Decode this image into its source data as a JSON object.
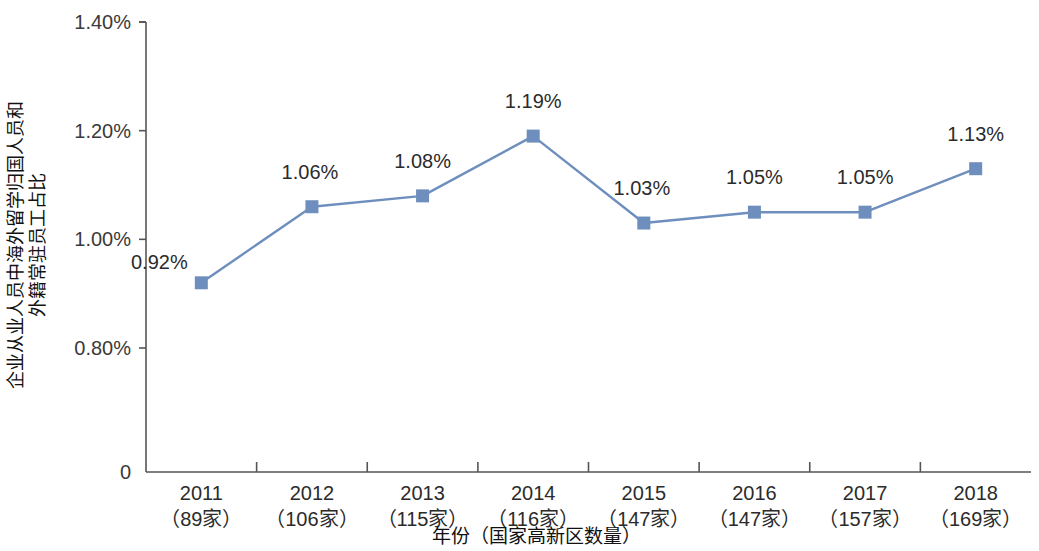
{
  "chart_data": {
    "type": "line",
    "title": "",
    "xlabel": "年份（国家高新区数量）",
    "ylabel": "企业从业人员中海外留学归国人员和外籍常驻员工占比",
    "ylabel_line1": "企业从业人员中海外留学归国人员和",
    "ylabel_line2": "外籍常驻员工占比",
    "categories": [
      "2011",
      "2012",
      "2013",
      "2014",
      "2015",
      "2016",
      "2017",
      "2018"
    ],
    "category_sublabels": [
      "（89家）",
      "（106家）",
      "（115家）",
      "（116家）",
      "（147家）",
      "（147家）",
      "（157家）",
      "（169家）"
    ],
    "values": [
      0.92,
      1.06,
      1.08,
      1.19,
      1.03,
      1.05,
      1.05,
      1.13
    ],
    "value_labels": [
      "0.92%",
      "1.06%",
      "1.08%",
      "1.19%",
      "1.03%",
      "1.05%",
      "1.05%",
      "1.13%"
    ],
    "ytick_labels": [
      "0",
      "0.80%",
      "1.00%",
      "1.20%",
      "1.40%"
    ],
    "ytick_values": [
      0,
      0.8,
      1.0,
      1.2,
      1.4
    ],
    "ylim": [
      0.8,
      1.4
    ],
    "axis_break": true,
    "grid": false,
    "legend": false,
    "series_color": "#6e8fbd",
    "marker": "square",
    "axis_color": "#555555"
  }
}
